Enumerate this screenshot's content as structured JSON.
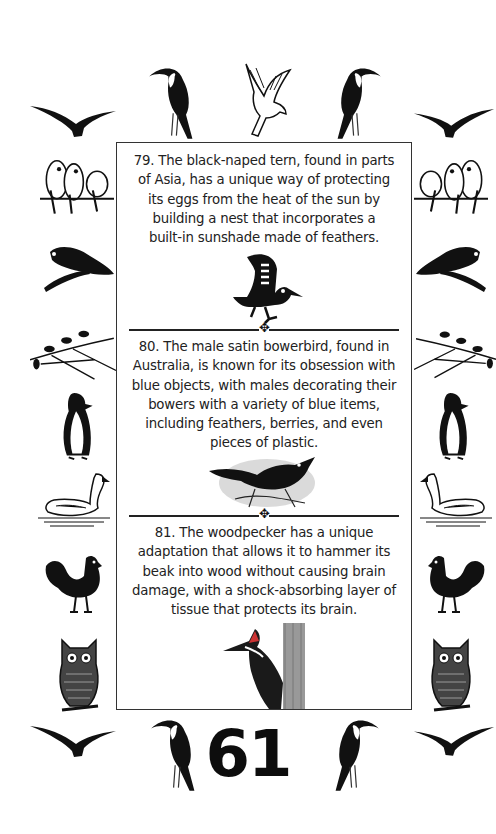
{
  "page": {
    "number": "61",
    "facts": [
      {
        "id": 79,
        "text": "79. The black-naped tern, found in parts of Asia, has a unique way of protecting its eggs from the heat of the sun by building a nest that incorporates a built-in sunshade made of feathers.",
        "lines": [
          "79. The black-naped tern, found in parts",
          "of Asia, has a unique way of protecting",
          "its eggs from the heat of the sun by",
          "building a nest that incorporates a",
          "built-in sunshade made of feathers."
        ],
        "illustration": "stylized-tern-icon"
      },
      {
        "id": 80,
        "text": "80. The male satin bowerbird, found in Australia, is known for its obsession with blue objects, with males decorating their bowers with a variety of blue items, including feathers, berries, and even pieces of plastic.",
        "lines": [
          "80. The male satin bowerbird, found in",
          "Australia, is known for its obsession with",
          "blue objects, with males decorating their",
          "bowers with a variety of blue items,",
          "including feathers, berries, and even",
          "pieces of plastic."
        ],
        "illustration": "bowerbird-engraving"
      },
      {
        "id": 81,
        "text": "81. The woodpecker has a unique adaptation that allows it to hammer its beak into wood without causing brain damage, with a shock-absorbing layer of tissue that protects its brain.",
        "lines": [
          "81. The woodpecker has a unique",
          "adaptation that allows it to hammer its",
          "beak into wood without causing brain",
          "damage, with a shock-absorbing layer of",
          "tissue that protects its brain."
        ],
        "illustration": "woodpecker-engraving"
      }
    ],
    "divider_ornament": "✥",
    "border_birds": {
      "top": [
        "flying-bird-silhouette",
        "toucan",
        "dove-flying",
        "toucan",
        "flying-bird-silhouette"
      ],
      "left": [
        "lovebirds-on-perch",
        "parrot-on-branch",
        "birds-on-branch",
        "penguin",
        "swan",
        "rooster",
        "owl"
      ],
      "right": [
        "lovebirds-on-perch",
        "parrot-on-branch",
        "birds-on-branch",
        "penguin",
        "swan",
        "rooster",
        "owl"
      ],
      "bottom": [
        "flying-bird-silhouette",
        "toucan",
        "toucan",
        "flying-bird-silhouette"
      ]
    },
    "colors": {
      "ink": "#1a1a1a",
      "background": "#ffffff",
      "border": "#333333"
    }
  }
}
